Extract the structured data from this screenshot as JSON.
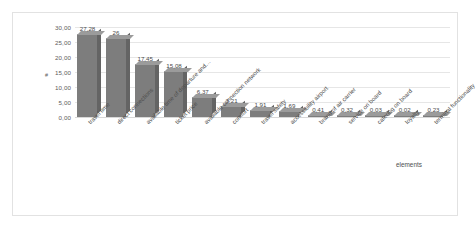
{
  "chart_data": {
    "type": "bar",
    "title": "",
    "xlabel": "elements",
    "ylabel": "#",
    "ylim": [
      0,
      30
    ],
    "ytick_labels": [
      "0,00",
      "5,00",
      "10,00",
      "15,00",
      "20,00",
      "25,00",
      "30,00"
    ],
    "ytick_values": [
      0,
      5,
      10,
      15,
      20,
      25,
      30
    ],
    "grid": true,
    "legend": "none",
    "bar_color": "#7d7d7d",
    "categories": [
      "travel time",
      "direct connections",
      "available time of departure and…",
      "ticket price",
      "available connection network",
      "comfort",
      "travel safety",
      "accessibility airport",
      "brand of air carrier",
      "service on board",
      "catering on board",
      "loyalty",
      "terminal functionality"
    ],
    "values": [
      27.28,
      26,
      17.45,
      15.08,
      6.37,
      3.21,
      1.91,
      1.69,
      0.41,
      0.32,
      0.03,
      0.02,
      0.23
    ],
    "data_labels": [
      "27,28",
      "26",
      "17,45",
      "15,08",
      "6,37",
      "3,21",
      "1,91",
      "1,69",
      "0,41",
      "0,32",
      "0,03",
      "0,02",
      "0,23"
    ]
  }
}
